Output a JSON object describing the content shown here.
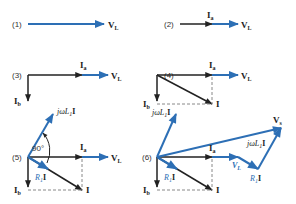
{
  "colors": {
    "blue": "#2d6fb5",
    "black": "#222222",
    "dash": "#888888"
  },
  "panels": [
    {
      "id": "1",
      "label": "(1)",
      "vectors": [
        "V_L"
      ]
    },
    {
      "id": "2",
      "label": "(2)",
      "vectors": [
        "I_a",
        "V_L"
      ]
    },
    {
      "id": "3",
      "label": "(3)",
      "vectors": [
        "I_a",
        "V_L",
        "I_b"
      ]
    },
    {
      "id": "4",
      "label": "(4)",
      "vectors": [
        "I_a",
        "V_L",
        "I_b",
        "I"
      ]
    },
    {
      "id": "5",
      "label": "(5)",
      "vectors": [
        "I_a",
        "V_L",
        "I_b",
        "I",
        "R_1 I",
        "jωL_1 I"
      ],
      "angle": "90°"
    },
    {
      "id": "6",
      "label": "(6)",
      "vectors": [
        "I_a",
        "V_L",
        "I_b",
        "I",
        "R_1 I",
        "jωL_1 I",
        "V_s"
      ]
    }
  ],
  "labels": {
    "p1": "(1)",
    "p2": "(2)",
    "p3": "(3)",
    "p4": "(4)",
    "p5": "(5)",
    "p6": "(6)",
    "vl": "V",
    "vl_sub": "L",
    "ia": "I",
    "ia_sub": "a",
    "ib": "I",
    "ib_sub": "b",
    "i": "I",
    "jwl": "jωL",
    "jwl_sub": "1",
    "jwl_suffix": "I",
    "r1": "R",
    "r1_sub": "1",
    "r1_suffix": "I",
    "vs": "V",
    "vs_sub": "s",
    "angle": "90°"
  }
}
